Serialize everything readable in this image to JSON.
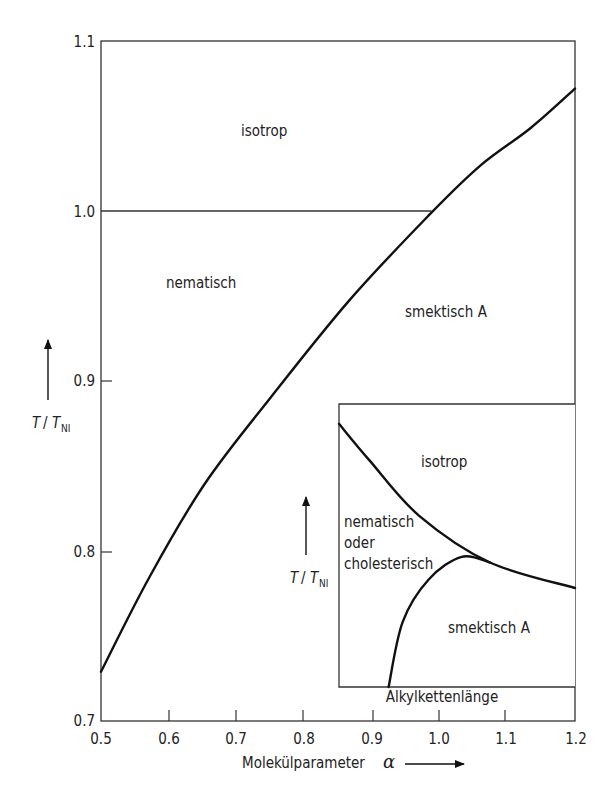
{
  "chart_data": [
    {
      "type": "line",
      "title": "",
      "xlabel": "Molekülparameter α",
      "ylabel": "T / T_NI",
      "xlim": [
        0.5,
        1.2
      ],
      "ylim": [
        0.7,
        1.1
      ],
      "xticks": [
        "0.5",
        "0.6",
        "0.7",
        "0.8",
        "0.9",
        "1.0",
        "1.1",
        "1.2"
      ],
      "yticks": [
        "0.7",
        "0.8",
        "0.9",
        "1.0",
        "1.1"
      ],
      "grid": false,
      "series": [
        {
          "name": "smektisch A / nematisch-isotrop boundary",
          "x": [
            0.5,
            0.572,
            0.654,
            0.75,
            0.868,
            0.988,
            1.061,
            1.135,
            1.2
          ],
          "y": [
            0.729,
            0.785,
            0.84,
            0.89,
            0.948,
            0.999,
            1.027,
            1.049,
            1.072
          ]
        },
        {
          "name": "nematisch-isotrop line",
          "x": [
            0.5,
            0.988
          ],
          "y": [
            1.0,
            1.0
          ]
        }
      ],
      "regions": [
        {
          "label": "isotrop",
          "x": 0.7,
          "y": 1.053
        },
        {
          "label": "nematisch",
          "x": 0.62,
          "y": 0.965
        },
        {
          "label": "smektisch A",
          "x": 1.02,
          "y": 0.94
        }
      ]
    },
    {
      "type": "line",
      "title": "Inset (schematic)",
      "xlabel": "Alkylkettenlänge",
      "ylabel": "T / T_NI",
      "xticks": [],
      "yticks": [],
      "grid": false,
      "series": [
        {
          "name": "isotrop boundary",
          "x": [
            0.0,
            0.13,
            0.34,
            0.64,
            1.0
          ],
          "y": [
            0.93,
            0.8,
            0.605,
            0.44,
            0.35
          ]
        },
        {
          "name": "smektisch A boundary",
          "x": [
            0.21,
            0.27,
            0.38,
            0.52,
            0.64
          ],
          "y": [
            0.0,
            0.23,
            0.38,
            0.46,
            0.44
          ]
        }
      ],
      "regions": [
        {
          "label": "isotrop"
        },
        {
          "label": "nematisch oder cholesterisch"
        },
        {
          "label": "smektisch A"
        }
      ]
    }
  ],
  "main": {
    "yticks": [
      "0.7",
      "0.8",
      "0.9",
      "1.0",
      "1.1"
    ],
    "xticks": [
      "0.5",
      "0.6",
      "0.7",
      "0.8",
      "0.9",
      "1.0",
      "1.1",
      "1.2"
    ],
    "xlabel": "Molekülparameter",
    "xlabel_symbol": "α",
    "ylabel_T": "T",
    "ylabel_sep": "/",
    "ylabel_TNI": "T",
    "ylabel_sub": "NI",
    "regions": {
      "isotrop": "isotrop",
      "nematisch": "nematisch",
      "smektisch": "smektisch A"
    }
  },
  "inset": {
    "xlabel": "Alkylkettenlänge",
    "ylabel_T": "T",
    "ylabel_sep": "/",
    "ylabel_TNI": "T",
    "ylabel_sub": "NI",
    "regions": {
      "isotrop": "isotrop",
      "nematisch_line1": "nematisch",
      "nematisch_line2": "oder",
      "nematisch_line3": "cholesterisch",
      "smektisch": "smektisch A"
    }
  }
}
